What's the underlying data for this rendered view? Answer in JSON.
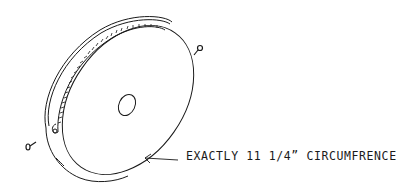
{
  "diagram": {
    "annotation": "EXACTLY 11 1/4” CIRCUMFRENCE",
    "line_color": "#1a1a1a",
    "background": "#ffffff"
  }
}
